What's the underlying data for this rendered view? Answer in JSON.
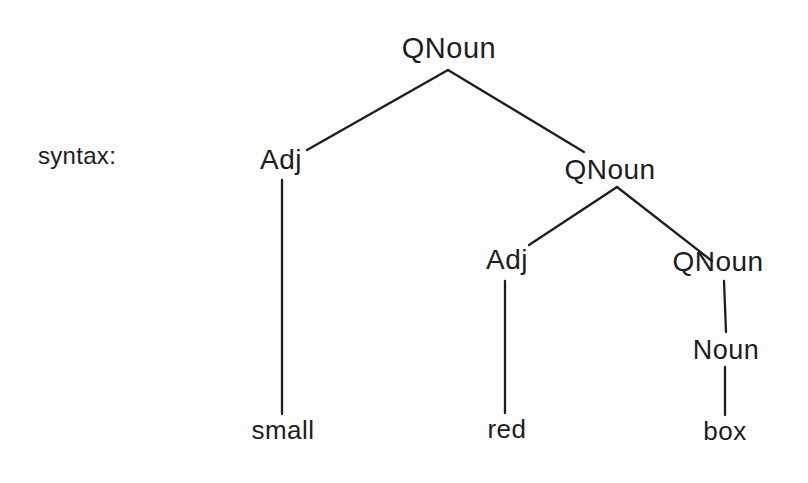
{
  "colors": {
    "ink": "#1d1d1d",
    "background": "#fdfdfd"
  },
  "caption": {
    "label": "syntax:"
  },
  "tree": {
    "nodes": {
      "root_qnoun": {
        "label": "QNoun"
      },
      "adj_left": {
        "label": "Adj"
      },
      "qnoun_mid": {
        "label": "QNoun"
      },
      "adj_inner": {
        "label": "Adj"
      },
      "qnoun_right": {
        "label": "QNoun"
      },
      "noun": {
        "label": "Noun"
      },
      "word_small": {
        "label": "small"
      },
      "word_red": {
        "label": "red"
      },
      "word_box": {
        "label": "box"
      }
    },
    "edges": [
      "root_qnoun-adj_left",
      "root_qnoun-qnoun_mid",
      "qnoun_mid-adj_inner",
      "qnoun_mid-qnoun_right",
      "adj_left-word_small",
      "adj_inner-word_red",
      "qnoun_right-noun",
      "noun-word_box"
    ]
  }
}
